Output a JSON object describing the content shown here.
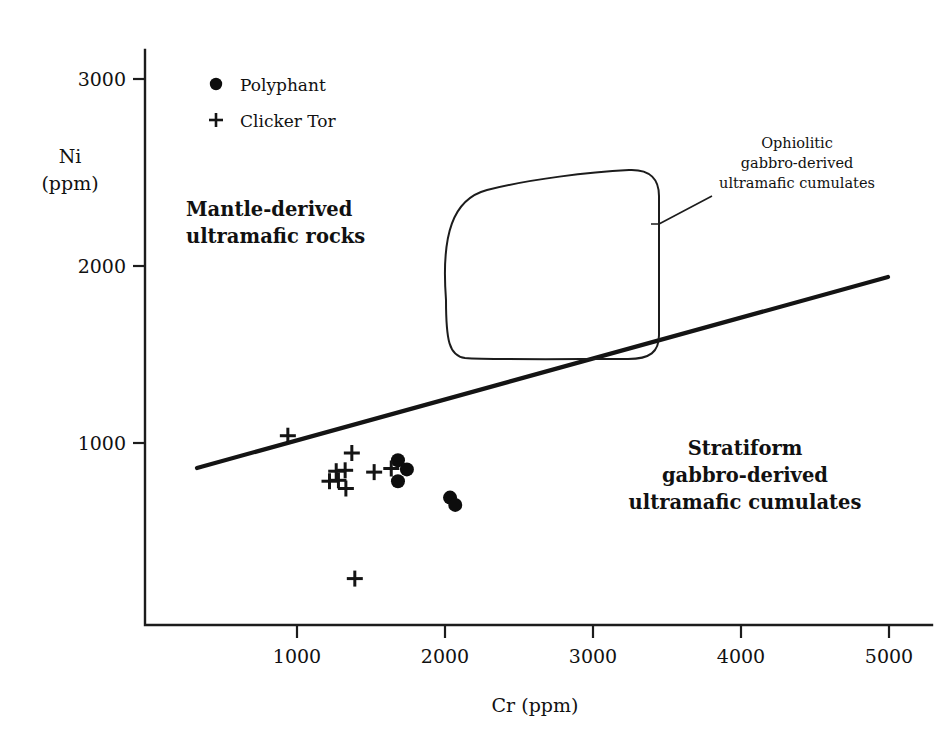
{
  "chart_data": {
    "type": "scatter",
    "title": "",
    "xlabel": "Cr (ppm)",
    "ylabel": "Ni (ppm)",
    "ylabel_line1": "Ni",
    "ylabel_line2": "(ppm)",
    "xlim": [
      0,
      5350
    ],
    "ylim": [
      0,
      3250
    ],
    "xticks": [
      1000,
      2000,
      3000,
      4000,
      5000
    ],
    "xticklabels": [
      "1000",
      "2000",
      "3000",
      "4000",
      "5000"
    ],
    "yticks": [
      1000,
      2000,
      3000
    ],
    "yticklabels": [
      "1000",
      "2000",
      "3000"
    ],
    "grid": false,
    "legend_position": "top-left-inside",
    "series": [
      {
        "name": "Polyphant",
        "marker": "filled-circle",
        "color": "#0d0d0d",
        "points": [
          {
            "x": 1700,
            "y": 905
          },
          {
            "x": 1760,
            "y": 855
          },
          {
            "x": 1700,
            "y": 790
          },
          {
            "x": 2050,
            "y": 700
          },
          {
            "x": 2085,
            "y": 660
          }
        ]
      },
      {
        "name": "Clicker Tor",
        "marker": "plus",
        "color": "#141414",
        "points": [
          {
            "x": 960,
            "y": 1040
          },
          {
            "x": 1390,
            "y": 945
          },
          {
            "x": 1285,
            "y": 845
          },
          {
            "x": 1345,
            "y": 850
          },
          {
            "x": 1240,
            "y": 790
          },
          {
            "x": 1300,
            "y": 795
          },
          {
            "x": 1350,
            "y": 750
          },
          {
            "x": 1540,
            "y": 840
          },
          {
            "x": 1655,
            "y": 860
          },
          {
            "x": 1410,
            "y": 255
          }
        ]
      }
    ],
    "divider_line": {
      "name": "mantle-cumulate-discriminant-line",
      "start": {
        "x": 330,
        "y": 880
      },
      "end": {
        "x": 5000,
        "y": 1920
      }
    },
    "field_outline": {
      "name": "ophiolitic-field-polygon",
      "closed": true,
      "vertices": [
        {
          "x": 1790,
          "y": 2390
        },
        {
          "x": 3390,
          "y": 2540
        },
        {
          "x": 3430,
          "y": 1590
        },
        {
          "x": 1800,
          "y": 1340
        }
      ]
    },
    "annotations": [
      {
        "name": "mantle-derived-field-label",
        "text_lines": [
          "Mantle-derived",
          "ultramafic rocks"
        ],
        "x": 1050,
        "y": 2220,
        "style": "bold"
      },
      {
        "name": "stratiform-field-label",
        "text_lines": [
          "Stratiform",
          "gabbro-derived",
          "ultramafic cumulates"
        ],
        "x": 3800,
        "y": 1000,
        "style": "bold"
      },
      {
        "name": "ophiolitic-field-label",
        "text_lines": [
          "Ophiolitic",
          "gabbro-derived",
          "ultramafic cumulates"
        ],
        "x": 4100,
        "y": 2800,
        "style": "regular",
        "has_leader_line": true
      }
    ]
  },
  "legend": {
    "items": [
      {
        "label": "Polyphant",
        "marker": "filled-circle"
      },
      {
        "label": "Clicker Tor",
        "marker": "plus"
      }
    ]
  },
  "axes": {
    "x_title": "Cr (ppm)",
    "y_title_line1": "Ni",
    "y_title_line2": "(ppm)",
    "x_tick_labels": [
      "1000",
      "2000",
      "3000",
      "4000",
      "5000"
    ],
    "y_tick_labels": [
      "3000",
      "2000",
      "1000"
    ]
  },
  "fields": {
    "mantle": {
      "l1": "Mantle-derived",
      "l2": "ultramafic rocks"
    },
    "stratiform": {
      "l1": "Stratiform",
      "l2": "gabbro-derived",
      "l3": "ultramafic cumulates"
    },
    "ophiolitic": {
      "l1": "Ophiolitic",
      "l2": "gabbro-derived",
      "l3": "ultramafic cumulates"
    }
  },
  "colors": {
    "ink": "#111111",
    "line": "#141414",
    "background": "#ffffff"
  }
}
